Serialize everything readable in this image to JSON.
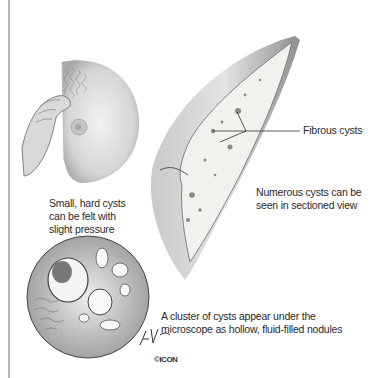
{
  "figure": {
    "labels": {
      "fibrous": "Fibrous cysts",
      "numerous": [
        "Numerous cysts can be",
        "seen in sectioned view"
      ],
      "small": [
        "Small, hard cysts",
        "can be felt with",
        "slight pressure"
      ],
      "cluster": [
        "A cluster of cysts appear under the",
        "microscope as hollow, fluid-filled nodules"
      ]
    },
    "signature": "F. Netter",
    "logo": "©ICON",
    "colors": {
      "frame_line": "#b5b5b5",
      "text": "#2a2a2a",
      "tissue": "#e9e6e2",
      "shadow": "#9a9a9a"
    }
  }
}
